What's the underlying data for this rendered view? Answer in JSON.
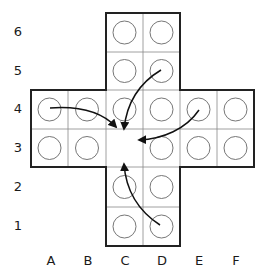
{
  "diagram": {
    "columns": [
      "A",
      "B",
      "C",
      "D",
      "E",
      "F"
    ],
    "rows": [
      "6",
      "5",
      "4",
      "3",
      "2",
      "1"
    ],
    "cells": [
      {
        "col": "C",
        "row": "6",
        "peg": true
      },
      {
        "col": "D",
        "row": "6",
        "peg": true
      },
      {
        "col": "C",
        "row": "5",
        "peg": true
      },
      {
        "col": "D",
        "row": "5",
        "peg": true
      },
      {
        "col": "A",
        "row": "4",
        "peg": true
      },
      {
        "col": "B",
        "row": "4",
        "peg": true
      },
      {
        "col": "C",
        "row": "4",
        "peg": true
      },
      {
        "col": "D",
        "row": "4",
        "peg": true
      },
      {
        "col": "E",
        "row": "4",
        "peg": true
      },
      {
        "col": "F",
        "row": "4",
        "peg": true
      },
      {
        "col": "A",
        "row": "3",
        "peg": true
      },
      {
        "col": "B",
        "row": "3",
        "peg": true
      },
      {
        "col": "C",
        "row": "3",
        "peg": false
      },
      {
        "col": "D",
        "row": "3",
        "peg": true
      },
      {
        "col": "E",
        "row": "3",
        "peg": true
      },
      {
        "col": "F",
        "row": "3",
        "peg": true
      },
      {
        "col": "C",
        "row": "2",
        "peg": true
      },
      {
        "col": "D",
        "row": "2",
        "peg": true
      },
      {
        "col": "C",
        "row": "1",
        "peg": true
      },
      {
        "col": "D",
        "row": "1",
        "peg": true
      }
    ],
    "moves": [
      {
        "from": "A4",
        "to": "C3"
      },
      {
        "from": "D5",
        "to": "C3"
      },
      {
        "from": "E4",
        "to": "C3"
      },
      {
        "from": "D1",
        "to": "C3"
      }
    ],
    "colors": {
      "line": "#222222",
      "grid": "#888888",
      "peg": "#666666",
      "arrow": "#111111"
    }
  }
}
